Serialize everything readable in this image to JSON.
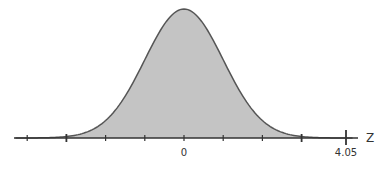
{
  "chart_data": {
    "type": "area",
    "title": "",
    "xlabel": "Z",
    "ylabel": "",
    "x_tick_labels": [
      {
        "value": 0,
        "label": "0"
      },
      {
        "value": 4.05,
        "label": "4.05"
      }
    ],
    "tick_positions_sd": [
      -4,
      -3,
      -2,
      -1,
      0,
      1,
      2,
      3,
      4.05
    ],
    "distribution": {
      "mean": 0,
      "sd": 1
    },
    "shaded_region": {
      "from": -3,
      "to": 3
    },
    "colors": {
      "fill": "#c4c4c4",
      "curve": "#555555",
      "axis": "#333333"
    },
    "grid": false
  },
  "labels": {
    "axis_name": "Z",
    "zero": "0",
    "marked_value": "4.05"
  }
}
